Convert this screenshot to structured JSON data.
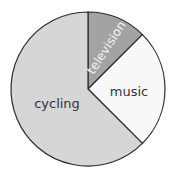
{
  "chart_data": {
    "type": "pie",
    "title": "",
    "start_angle_deg": 0,
    "direction": "clockwise",
    "slices": [
      {
        "label": "television",
        "value": 12.5,
        "color": "#a3a3a3"
      },
      {
        "label": "music",
        "value": 25,
        "color": "#f8f8f8"
      },
      {
        "label": "cycling",
        "value": 62.5,
        "color": "#d6d6d6"
      }
    ],
    "units": "percent (estimated from angles)",
    "legend": "none (labels inside slices)"
  }
}
